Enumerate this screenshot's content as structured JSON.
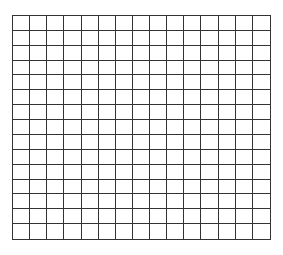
{
  "grid": {
    "columns": 15,
    "rows": 15,
    "line_color": "#333333",
    "background": "#ffffff"
  }
}
